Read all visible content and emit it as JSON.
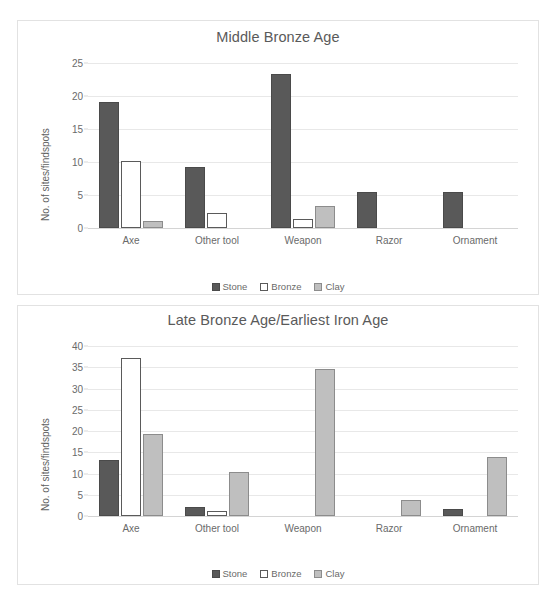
{
  "chart_data": [
    {
      "id": "middle-bronze-age",
      "type": "bar",
      "title": "Middle Bronze Age",
      "xlabel": "",
      "ylabel": "No. of sites/findspots",
      "categories": [
        "Axe",
        "Other tool",
        "Weapon",
        "Razor",
        "Ornament"
      ],
      "yticks": [
        0,
        5,
        10,
        15,
        20,
        25
      ],
      "ylim": [
        0,
        25
      ],
      "grid": true,
      "legend_position": "bottom",
      "series": [
        {
          "name": "Stone",
          "color": "#595959",
          "values": [
            19.1,
            9.2,
            23.4,
            5.4,
            5.5
          ]
        },
        {
          "name": "Bronze",
          "color": "#ffffff",
          "values": [
            10.1,
            2.2,
            1.3,
            0,
            0
          ]
        },
        {
          "name": "Clay",
          "color": "#bfbfbf",
          "values": [
            1.1,
            0,
            3.4,
            0,
            0
          ]
        }
      ]
    },
    {
      "id": "late-bronze-age-earliest-iron-age",
      "type": "bar",
      "title": "Late Bronze Age/Earliest Iron Age",
      "xlabel": "",
      "ylabel": "No. of sites/findspots",
      "categories": [
        "Axe",
        "Other tool",
        "Weapon",
        "Razor",
        "Ornament"
      ],
      "yticks": [
        0,
        5,
        10,
        15,
        20,
        25,
        30,
        35,
        40
      ],
      "ylim": [
        0,
        40
      ],
      "grid": true,
      "legend_position": "bottom",
      "series": [
        {
          "name": "Stone",
          "color": "#595959",
          "values": [
            13.1,
            2.2,
            0,
            0,
            1.6
          ]
        },
        {
          "name": "Bronze",
          "color": "#ffffff",
          "values": [
            37.1,
            1.1,
            0,
            0,
            0
          ]
        },
        {
          "name": "Clay",
          "color": "#bfbfbf",
          "values": [
            19.2,
            10.3,
            34.6,
            3.7,
            14.0
          ]
        }
      ]
    }
  ]
}
